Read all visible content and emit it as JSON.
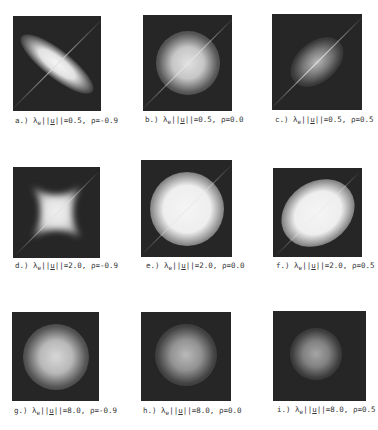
{
  "figure": {
    "panels": [
      {
        "id": "a",
        "letter": "a.)",
        "lambda_u": "0.5",
        "rho": "-0.9",
        "box": [
          13,
          16,
          88,
          95
        ],
        "shape": "ellipse-neg",
        "brightness": 0.95
      },
      {
        "id": "b",
        "letter": "b.)",
        "lambda_u": "0.5",
        "rho": "0.0",
        "box": [
          143,
          15,
          89,
          96
        ],
        "shape": "round",
        "brightness": 0.8
      },
      {
        "id": "c",
        "letter": "c.)",
        "lambda_u": "0.5",
        "rho": "0.5",
        "box": [
          272,
          14,
          90,
          96
        ],
        "shape": "ellipse-pos",
        "brightness": 0.6
      },
      {
        "id": "d",
        "letter": "d.)",
        "lambda_u": "2.0",
        "rho": "-0.9",
        "box": [
          13,
          167,
          87,
          91
        ],
        "shape": "star",
        "brightness": 0.95
      },
      {
        "id": "e",
        "letter": "e.)",
        "lambda_u": "2.0",
        "rho": "0.0",
        "box": [
          141,
          160,
          91,
          97
        ],
        "shape": "round-large",
        "brightness": 1.0
      },
      {
        "id": "f",
        "letter": "f.)",
        "lambda_u": "2.0",
        "rho": "0.5",
        "box": [
          273,
          168,
          89,
          89
        ],
        "shape": "ellipse-pos-large",
        "brightness": 1.0
      },
      {
        "id": "g",
        "letter": "g.)",
        "lambda_u": "8.0",
        "rho": "-0.9",
        "box": [
          12,
          312,
          87,
          89
        ],
        "shape": "round-soft",
        "brightness": 0.85
      },
      {
        "id": "h",
        "letter": "h.)",
        "lambda_u": "8.0",
        "rho": "0.0",
        "box": [
          141,
          312,
          90,
          89
        ],
        "shape": "round-soft",
        "brightness": 0.7
      },
      {
        "id": "i",
        "letter": "i.)",
        "lambda_u": "8.0",
        "rho": "0.5",
        "box": [
          273,
          311,
          93,
          90
        ],
        "shape": "round-soft-small",
        "brightness": 0.6
      }
    ],
    "captions": {
      "a": {
        "letter": "a.)",
        "lam": "λ",
        "sub": "e",
        "u": "u",
        "value": "=0.5,",
        "rho": "ρ=-0.9"
      },
      "b": {
        "letter": "b.)",
        "lam": "λ",
        "sub": "e",
        "u": "u",
        "value": "=0.5,",
        "rho": "ρ=0.0"
      },
      "c": {
        "letter": "c.)",
        "lam": "λ",
        "sub": "e",
        "u": "u",
        "value": "=0.5,",
        "rho": "ρ=0.5"
      },
      "d": {
        "letter": "d.)",
        "lam": "λ",
        "sub": "e",
        "u": "u",
        "value": "=2.0,",
        "rho": "ρ=-0.9"
      },
      "e": {
        "letter": "e.)",
        "lam": "λ",
        "sub": "e",
        "u": "u",
        "value": "=2.0,",
        "rho": "ρ=0.0"
      },
      "f": {
        "letter": "f.)",
        "lam": "λ",
        "sub": "e",
        "u": "u",
        "value": "=2.0,",
        "rho": "ρ=0.5"
      },
      "g": {
        "letter": "g.)",
        "lam": "λ",
        "sub": "e",
        "u": "u",
        "value": "=8.0,",
        "rho": "ρ=-0.9"
      },
      "h": {
        "letter": "h.)",
        "lam": "λ",
        "sub": "e",
        "u": "u",
        "value": "=8.0,",
        "rho": "ρ=0.0"
      },
      "i": {
        "letter": "i.)",
        "lam": "λ",
        "sub": "e",
        "u": "u",
        "value": "=8.0,",
        "rho": "ρ=0.5"
      }
    },
    "colors": {
      "panel_bg": "#262626",
      "glow": "#f2f2f2",
      "caption": "#333333"
    }
  }
}
